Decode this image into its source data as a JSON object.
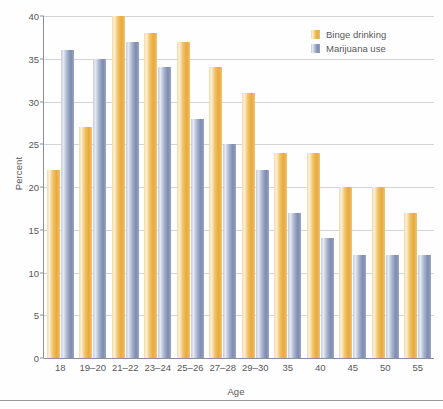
{
  "chart_data": {
    "type": "bar",
    "title": "",
    "subtitle": "",
    "xlabel": "Age",
    "ylabel": "Percent",
    "categories": [
      "18",
      "19–20",
      "21–22",
      "23–24",
      "25–26",
      "27–28",
      "29–30",
      "35",
      "40",
      "45",
      "50",
      "55"
    ],
    "series": [
      {
        "name": "Binge drinking",
        "color": "#e9a93c",
        "values": [
          22,
          27,
          40,
          38,
          37,
          34,
          31,
          24,
          24,
          20,
          20,
          17
        ]
      },
      {
        "name": "Marijuana use",
        "color": "#7d8bb0",
        "values": [
          36,
          35,
          37,
          34,
          28,
          25,
          22,
          17,
          14,
          12,
          12,
          12
        ]
      }
    ],
    "ylim": [
      0,
      40
    ],
    "yticks": [
      0,
      5,
      10,
      15,
      20,
      25,
      30,
      35,
      40
    ],
    "ytick_labels": [
      "0",
      "5",
      "10",
      "15",
      "20",
      "25",
      "30",
      "35",
      "40"
    ],
    "grid": true,
    "grid_axis": "y",
    "legend_position": "top-right",
    "annotations": []
  },
  "legend": {
    "entries": [
      {
        "label": "Binge drinking"
      },
      {
        "label": "Marijuana use"
      }
    ]
  },
  "axes": {
    "x_title": "Age",
    "y_title": "Percent"
  }
}
